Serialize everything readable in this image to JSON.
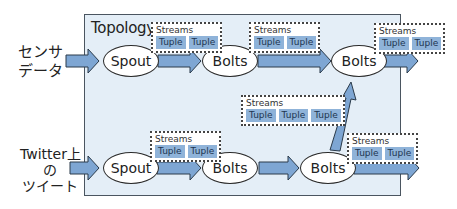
{
  "topology": {
    "title": "Topology"
  },
  "inputs": [
    {
      "label_lines": [
        "センサ",
        "データ"
      ]
    },
    {
      "label_lines": [
        "Twitter上",
        "の",
        "ツイート"
      ]
    }
  ],
  "nodes": {
    "top_spout": "Spout",
    "top_bolt1": "Bolts",
    "top_bolt2": "Bolts",
    "bottom_spout": "Spout",
    "bottom_bolt1": "Bolts",
    "bottom_bolt2": "Bolts"
  },
  "streams": {
    "label": "Streams",
    "tuple_label": "Tuple",
    "top_1": [
      "Tuple",
      "Tuple"
    ],
    "top_2": [
      "Tuple",
      "Tuple"
    ],
    "top_out": [
      "Tuple",
      "Tuple"
    ],
    "middle": [
      "Tuple",
      "Tuple",
      "Tuple"
    ],
    "bottom_1": [
      "Tuple",
      "Tuple"
    ],
    "bottom_out": [
      "Tuple",
      "Tuple"
    ]
  },
  "colors": {
    "topology_bg": "#e4eef7",
    "arrow_fill": "#7ea6d3",
    "tuple_fill": "#8fb3d9"
  }
}
